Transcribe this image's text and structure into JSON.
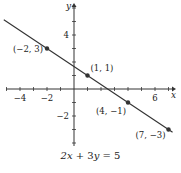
{
  "chart_data": {
    "type": "line",
    "title": "2x + 3y = 5",
    "xlabel": "x",
    "ylabel": "y",
    "xlim": [
      -5.4,
      7.3
    ],
    "ylim": [
      -4,
      6.4
    ],
    "grid": false,
    "x_ticks": [
      -4,
      -2,
      6
    ],
    "y_ticks": [
      4,
      -2
    ],
    "x_tick_labels": [
      "−4",
      "−2",
      "6"
    ],
    "y_tick_labels": [
      "4",
      "−2"
    ],
    "series": [
      {
        "name": "2x + 3y = 5",
        "equation": "y = (5 - 2x) / 3",
        "line_range_x": [
          -5.2,
          7.3
        ],
        "color": "#333333"
      }
    ],
    "points": [
      {
        "x": -2,
        "y": 3,
        "label": "(−2, 3)"
      },
      {
        "x": 1,
        "y": 1,
        "label": "(1, 1)"
      },
      {
        "x": 4,
        "y": -1,
        "label": "(4, −1)"
      },
      {
        "x": 7,
        "y": -3,
        "label": "(7, −3)"
      }
    ]
  },
  "caption": "2x + 3y = 5"
}
